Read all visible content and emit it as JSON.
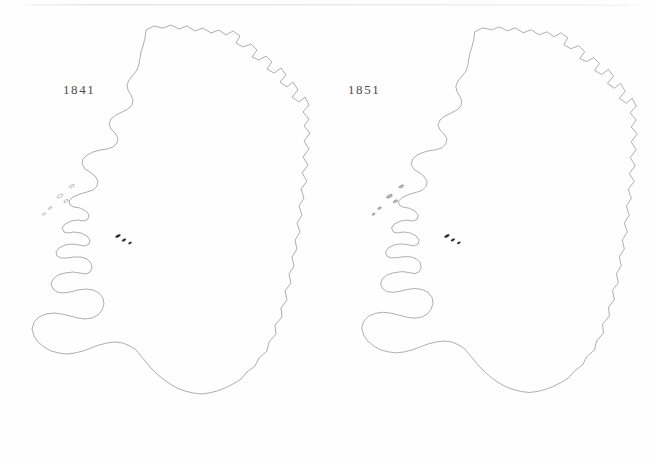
{
  "plate": {
    "background_color": "#fefefe",
    "scan_line_color": "#e8e8e8",
    "boundary_stroke_color": "#5f5f5f",
    "panels": [
      {
        "id": "map-1841",
        "year_label": "1841",
        "label_x": 63,
        "label_y": 82
      },
      {
        "id": "map-1851",
        "year_label": "1851",
        "label_x": 348,
        "label_y": 82
      }
    ]
  },
  "chart_data": {
    "type": "heatmap",
    "title": "",
    "subtitle": "",
    "xlabel": "",
    "ylabel": "",
    "grid": false,
    "legend": "none",
    "panels": [
      {
        "label": "1841",
        "mean_level": 2.45,
        "dark_share": 0.07
      },
      {
        "label": "1851",
        "mean_level": 3.75,
        "dark_share": 0.27
      }
    ],
    "categories": [
      "level0",
      "level1",
      "level2",
      "level3",
      "level4",
      "level5"
    ],
    "series": [
      {
        "name": "1841",
        "values": [
          62,
          96,
          104,
          70,
          30,
          14
        ]
      },
      {
        "name": "1851",
        "values": [
          14,
          52,
          82,
          110,
          62,
          56
        ]
      }
    ],
    "scale_colors": [
      "#ffffff",
      "#dcdcdc",
      "#b9b9b9",
      "#949494",
      "#6b6b6b",
      "#1b1b1b"
    ],
    "scale_labels": [
      "lightest",
      "light",
      "medium light",
      "medium",
      "dark",
      "darkest"
    ]
  },
  "geometry": {
    "viewbox": [
      0,
      0,
      330,
      461
    ],
    "outline_1841": "M146,30 L152,27 L160,29 L166,27 L172,31 L178,29 L184,33 L190,31 L197,35 L204,32 L210,36 L216,33 L222,37 L228,34 L233,39 L239,36 L244,41 L238,46 L243,50 L250,47 L256,52 L252,58 L258,61 L264,57 L270,62 L266,68 L272,72 L279,68 L284,74 L279,80 L285,85 L291,81 L296,88 L291,95 L297,100 L303,96 L307,103 L302,110 L307,117 L303,124 L308,131 L303,139 L307,147 L302,155 L306,163 L301,171 L305,179 L300,187 L303,196 L298,204 L301,213 L296,221 L299,230 L294,238 L296,247 L291,255 L293,264 L288,272 L290,281 L284,289 L286,298 L280,306 L281,315 L274,323 L275,332 L268,340 L266,349 L258,356 L254,364 L246,370 L240,377 L232,382 L224,386 L216,389 L208,391 L200,392 L192,391 L184,389 L176,386 L169,382 L162,377 L156,372 L150,366 L145,360 L140,354 L135,348 L129,344 L122,341 L114,340 L106,341 L98,343 L90,346 L82,349 L74,351 L66,352 L58,351 L50,349 L43,345 L37,340 L33,334 L31,327 L33,320 L38,315 L45,312 L53,311 L61,312 L69,314 L77,316 L84,317 L91,316 L97,313 L101,308 L103,302 L102,296 L98,291 L92,288 L85,287 L77,288 L69,290 L62,291 L56,290 L52,287 L50,282 L52,277 L57,273 L64,271 L72,270 L79,271 L85,272 L89,270 L91,266 L90,261 L86,257 L80,255 L73,255 L66,256 L60,256 L56,254 L55,250 L58,246 L64,243 L71,242 L78,243 L84,244 L88,242 L89,238 L86,234 L80,231 L73,230 L67,231 L63,230 L61,226 L64,222 L70,219 L77,218 L83,219 L87,217 L88,213 L85,209 L79,206 L73,205 L69,203 L68,199 L72,195 L79,192 L86,190 L92,188 L96,184 L97,179 L94,174 L89,170 L84,167 L81,162 L82,157 L86,153 L92,150 L99,148 L106,147 L112,145 L116,141 L117,136 L114,131 L110,127 L108,122 L110,117 L115,113 L121,110 L127,107 L131,103 L132,98 L130,93 L127,88 L126,83 L128,78 L132,73 L136,68 L138,62 L139,56 L140,50 L142,44 L144,37 Z",
    "cell_count_1841": 376,
    "cell_count_1851": 376
  },
  "shading": {
    "note": "levels index into chart_data.scale_colors; per-district shading is generated from the seeded region model below",
    "regions_1841": [
      {
        "name": "donegal",
        "cx": 196,
        "cy": 62,
        "level": 3
      },
      {
        "name": "north-antrim",
        "cx": 268,
        "cy": 62,
        "level": 3
      },
      {
        "name": "belfast-lough",
        "cx": 281,
        "cy": 92,
        "level": 2
      },
      {
        "name": "armagh-down",
        "cx": 262,
        "cy": 112,
        "level": 3
      },
      {
        "name": "tyrone",
        "cx": 232,
        "cy": 88,
        "level": 3
      },
      {
        "name": "fermanagh",
        "cx": 206,
        "cy": 104,
        "level": 2
      },
      {
        "name": "sligo-leitrim",
        "cx": 166,
        "cy": 112,
        "level": 3
      },
      {
        "name": "north-mayo",
        "cx": 122,
        "cy": 118,
        "level": 2
      },
      {
        "name": "west-mayo",
        "cx": 92,
        "cy": 152,
        "level": 1
      },
      {
        "name": "clew-bay",
        "cx": 86,
        "cy": 176,
        "level": 1
      },
      {
        "name": "connemara",
        "cx": 88,
        "cy": 212,
        "level": 1
      },
      {
        "name": "east-galway",
        "cx": 150,
        "cy": 208,
        "level": 4
      },
      {
        "name": "roscommon",
        "cx": 168,
        "cy": 160,
        "level": 3
      },
      {
        "name": "longford-westmeath",
        "cx": 206,
        "cy": 158,
        "level": 3
      },
      {
        "name": "meath",
        "cx": 252,
        "cy": 150,
        "level": 2
      },
      {
        "name": "dublin",
        "cx": 282,
        "cy": 178,
        "level": 3
      },
      {
        "name": "kildare-offaly",
        "cx": 228,
        "cy": 200,
        "level": 4
      },
      {
        "name": "laois-carlow",
        "cx": 242,
        "cy": 228,
        "level": 4
      },
      {
        "name": "north-tipperary",
        "cx": 194,
        "cy": 228,
        "level": 5
      },
      {
        "name": "limerick",
        "cx": 154,
        "cy": 252,
        "level": 2
      },
      {
        "name": "clare",
        "cx": 130,
        "cy": 228,
        "level": 2
      },
      {
        "name": "north-kerry",
        "cx": 104,
        "cy": 268,
        "level": 1
      },
      {
        "name": "south-kerry",
        "cx": 78,
        "cy": 312,
        "level": 0
      },
      {
        "name": "west-cork",
        "cx": 110,
        "cy": 340,
        "level": 0
      },
      {
        "name": "mid-cork",
        "cx": 158,
        "cy": 318,
        "level": 1
      },
      {
        "name": "east-cork",
        "cx": 196,
        "cy": 330,
        "level": 1
      },
      {
        "name": "waterford",
        "cx": 230,
        "cy": 312,
        "level": 2
      },
      {
        "name": "south-tipperary",
        "cx": 206,
        "cy": 278,
        "level": 3
      },
      {
        "name": "kilkenny",
        "cx": 238,
        "cy": 268,
        "level": 2
      },
      {
        "name": "wexford",
        "cx": 272,
        "cy": 286,
        "level": 2
      },
      {
        "name": "wicklow",
        "cx": 280,
        "cy": 234,
        "level": 3
      },
      {
        "name": "cavan-monaghan",
        "cx": 236,
        "cy": 124,
        "level": 3
      }
    ],
    "regions_1851": [
      {
        "name": "donegal",
        "cx": 196,
        "cy": 62,
        "level": 5
      },
      {
        "name": "north-antrim",
        "cx": 268,
        "cy": 62,
        "level": 5
      },
      {
        "name": "belfast-lough",
        "cx": 281,
        "cy": 92,
        "level": 2
      },
      {
        "name": "armagh-down",
        "cx": 262,
        "cy": 112,
        "level": 3
      },
      {
        "name": "tyrone",
        "cx": 232,
        "cy": 88,
        "level": 3
      },
      {
        "name": "fermanagh",
        "cx": 206,
        "cy": 104,
        "level": 4
      },
      {
        "name": "sligo-leitrim",
        "cx": 166,
        "cy": 112,
        "level": 5
      },
      {
        "name": "north-mayo",
        "cx": 122,
        "cy": 118,
        "level": 5
      },
      {
        "name": "west-mayo",
        "cx": 92,
        "cy": 152,
        "level": 5
      },
      {
        "name": "clew-bay",
        "cx": 86,
        "cy": 176,
        "level": 5
      },
      {
        "name": "connemara",
        "cx": 88,
        "cy": 212,
        "level": 4
      },
      {
        "name": "east-galway",
        "cx": 150,
        "cy": 208,
        "level": 4
      },
      {
        "name": "roscommon",
        "cx": 168,
        "cy": 160,
        "level": 5
      },
      {
        "name": "longford-westmeath",
        "cx": 206,
        "cy": 158,
        "level": 4
      },
      {
        "name": "meath",
        "cx": 252,
        "cy": 150,
        "level": 3
      },
      {
        "name": "dublin",
        "cx": 282,
        "cy": 178,
        "level": 1
      },
      {
        "name": "kildare-offaly",
        "cx": 228,
        "cy": 200,
        "level": 3
      },
      {
        "name": "laois-carlow",
        "cx": 242,
        "cy": 228,
        "level": 3
      },
      {
        "name": "north-tipperary",
        "cx": 194,
        "cy": 228,
        "level": 4
      },
      {
        "name": "limerick",
        "cx": 154,
        "cy": 252,
        "level": 3
      },
      {
        "name": "clare",
        "cx": 130,
        "cy": 228,
        "level": 4
      },
      {
        "name": "north-kerry",
        "cx": 104,
        "cy": 268,
        "level": 5
      },
      {
        "name": "south-kerry",
        "cx": 78,
        "cy": 312,
        "level": 3
      },
      {
        "name": "west-cork",
        "cx": 110,
        "cy": 340,
        "level": 3
      },
      {
        "name": "mid-cork",
        "cx": 158,
        "cy": 318,
        "level": 2
      },
      {
        "name": "east-cork",
        "cx": 196,
        "cy": 330,
        "level": 2
      },
      {
        "name": "waterford",
        "cx": 230,
        "cy": 312,
        "level": 3
      },
      {
        "name": "south-tipperary",
        "cx": 206,
        "cy": 278,
        "level": 3
      },
      {
        "name": "kilkenny",
        "cx": 238,
        "cy": 268,
        "level": 2
      },
      {
        "name": "wexford",
        "cx": 272,
        "cy": 286,
        "level": 3
      },
      {
        "name": "wicklow",
        "cx": 280,
        "cy": 234,
        "level": 3
      },
      {
        "name": "cavan-monaghan",
        "cx": 236,
        "cy": 124,
        "level": 4
      }
    ]
  }
}
